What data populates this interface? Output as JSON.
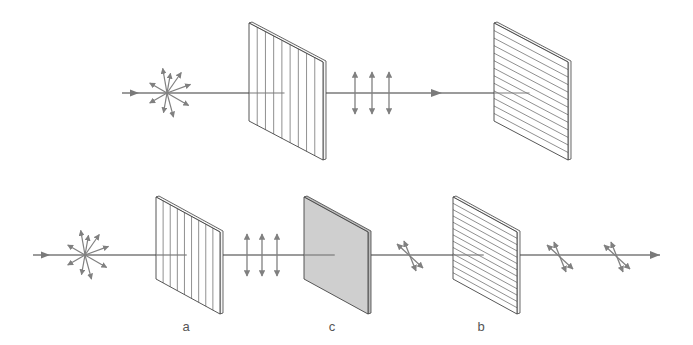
{
  "diagram": {
    "colors": {
      "beam": "#7a7a7a",
      "arrow": "#808080",
      "panel_stroke": "#444444",
      "panel_fill": "#ffffff",
      "tinted_panel_fill": "#cfcfcf",
      "label": "#555555"
    },
    "rows": [
      {
        "id": "top",
        "beam_y": 93,
        "beam_start_x": 122,
        "beam_end_x": 555,
        "elements": [
          {
            "type": "unpolarized-source",
            "x": 167,
            "y": 93
          },
          {
            "type": "polarizer",
            "orientation": "vertical",
            "x": 249,
            "y": 23,
            "w": 74,
            "skew": 39,
            "h": 98
          },
          {
            "type": "vertical-polarization",
            "xs": [
              355,
              372,
              389
            ],
            "y": 93
          },
          {
            "type": "direction-arrow",
            "x": 440,
            "y": 93
          },
          {
            "type": "polarizer",
            "orientation": "horizontal",
            "x": 494,
            "y": 23,
            "w": 74,
            "skew": 39,
            "h": 98
          }
        ]
      },
      {
        "id": "bottom",
        "beam_y": 255,
        "beam_start_x": 33,
        "beam_end_x": 660,
        "elements": [
          {
            "type": "unpolarized-source",
            "x": 85,
            "y": 255
          },
          {
            "type": "polarizer",
            "orientation": "vertical",
            "label": "a",
            "x": 156,
            "y": 197,
            "w": 64,
            "skew": 35,
            "h": 82
          },
          {
            "type": "vertical-polarization",
            "xs": [
              247,
              262,
              277
            ],
            "y": 255
          },
          {
            "type": "wave-plate",
            "label": "c",
            "x": 304,
            "y": 197,
            "w": 64,
            "skew": 35,
            "h": 82
          },
          {
            "type": "diagonal-polarization",
            "x": 410,
            "y": 256
          },
          {
            "type": "polarizer",
            "orientation": "horizontal",
            "label": "b",
            "x": 453,
            "y": 197,
            "w": 64,
            "skew": 35,
            "h": 82
          },
          {
            "type": "diagonal-polarization",
            "x": 560,
            "y": 257
          },
          {
            "type": "diagonal-polarization",
            "x": 617,
            "y": 257
          }
        ]
      }
    ],
    "labels": [
      {
        "text": "a",
        "x": 186,
        "y": 326
      },
      {
        "text": "c",
        "x": 332,
        "y": 326
      },
      {
        "text": "b",
        "x": 481,
        "y": 326
      }
    ]
  }
}
